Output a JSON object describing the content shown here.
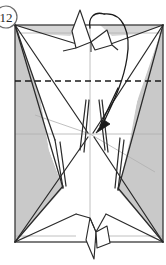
{
  "figure": {
    "step_number": "12",
    "step_badge_shape": "circle"
  },
  "colors": {
    "paper_white": "#ffffff",
    "paper_shaded": "#c9c9c9",
    "paper_shaded_light": "#d6d6d6",
    "outline": "#2b2b2b",
    "crease_faint": "#b0b0b0",
    "fold_dashed": "#1a1a1a",
    "arrow": "#1a1a1a",
    "background": "#ffffff"
  },
  "canvas": {
    "width": 166,
    "height": 265
  },
  "model": {
    "outer_rect": {
      "left": 15,
      "top": 25,
      "right": 163,
      "bottom": 242,
      "label": "main-paper-rectangle"
    },
    "center_lines": {
      "vertical_x": 90,
      "horizontal_y": 134
    },
    "fold_line": {
      "type": "valley-fold-dashed",
      "y": 81,
      "x_start": 15,
      "x_end": 163,
      "dash_pattern": "6 4"
    }
  },
  "annotations": {
    "fold_arrow": {
      "type": "curved-fold-arrow",
      "description": "Curved arrow looping from the top flap down into the center of the model",
      "start_x": 105,
      "start_y": 14,
      "end_x": 100,
      "end_y": 129,
      "arrowhead": "solid-triangle",
      "arrowhead_direction": "down-left"
    }
  },
  "legend": {
    "dashed_line_meaning": "valley fold",
    "solid_line_meaning": "paper edge",
    "faint_line_meaning": "existing crease",
    "shaded_meaning": "reverse side of paper"
  }
}
